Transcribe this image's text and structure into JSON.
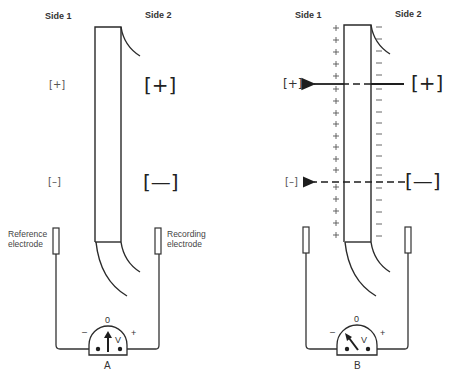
{
  "panels": [
    {
      "id": "A",
      "caption": "A",
      "side1_label": "Side 1",
      "side2_label": "Side 2",
      "side1_ion": "[+]",
      "side1_anion": "[–]",
      "side2_ion": "[+]",
      "side2_anion": "[—]",
      "reference_electrode_label_line1": "Reference",
      "reference_electrode_label_line2": "electrode",
      "recording_electrode_label_line1": "Recording",
      "recording_electrode_label_line2": "electrode",
      "meter": {
        "zero": "0",
        "minus": "–",
        "plus": "+",
        "unit": "V",
        "needle": "center"
      }
    },
    {
      "id": "B",
      "caption": "B",
      "side1_label": "Side 1",
      "side2_label": "Side 2",
      "side1_ion": "[+]",
      "side1_anion": "[–]",
      "side2_ion": "[+]",
      "side2_anion": "[—]",
      "membrane_outer_charge": "+",
      "membrane_inner_charge": "–",
      "meter": {
        "zero": "0",
        "minus": "–",
        "plus": "+",
        "unit": "V",
        "needle": "deflected-negative"
      },
      "arrows": [
        {
          "ion": "[+]",
          "style": "solid",
          "direction": "side2-to-side1"
        },
        {
          "ion": "[–]",
          "style": "dashed",
          "direction": "side2-to-side1"
        }
      ]
    }
  ]
}
